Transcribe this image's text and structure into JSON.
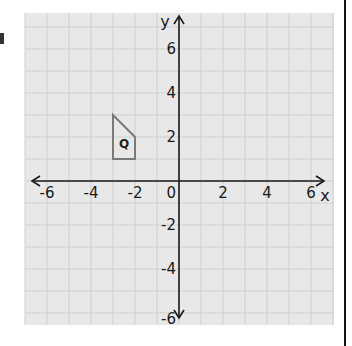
{
  "figure": {
    "type": "coordinate-grid",
    "x_axis_label": "x",
    "y_axis_label": "y",
    "origin_label": "0",
    "x_range": [
      -7,
      7
    ],
    "y_range": [
      -6.5,
      7.5
    ],
    "x_ticks": [
      {
        "value": -6,
        "label": "-6"
      },
      {
        "value": -4,
        "label": "-4"
      },
      {
        "value": -2,
        "label": "-2"
      },
      {
        "value": 2,
        "label": "2"
      },
      {
        "value": 4,
        "label": "4"
      },
      {
        "value": 6,
        "label": "6"
      }
    ],
    "y_ticks": [
      {
        "value": 6,
        "label": "6"
      },
      {
        "value": 4,
        "label": "4"
      },
      {
        "value": 2,
        "label": "2"
      },
      {
        "value": -2,
        "label": "-2"
      },
      {
        "value": -4,
        "label": "-4"
      },
      {
        "value": -6,
        "label": "-6"
      }
    ],
    "grid_step": 1,
    "colors": {
      "grid_background": "#e8e8e8",
      "grid_line": "#cfcfcf",
      "axis": "#1a1a1a",
      "shape_stroke": "#7a7a7a"
    }
  },
  "shapes": [
    {
      "name": "Q",
      "label": "Q",
      "vertices": [
        [
          -3,
          3
        ],
        [
          -2,
          2
        ],
        [
          -2,
          1
        ],
        [
          -3,
          1
        ]
      ],
      "label_position": [
        -2.5,
        1.7
      ]
    }
  ]
}
